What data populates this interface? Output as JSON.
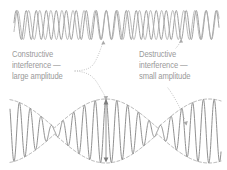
{
  "figure": {
    "background_color": "#ffffff",
    "wave_color": "#8e8e8e",
    "wave_color_secondary": "#a8a8a8",
    "envelope_color": "#8e8e8e",
    "text_color": "#9a9a9a",
    "arrow_color": "#b0b0b0"
  },
  "annotations": {
    "constructive": {
      "line1": "Constructive",
      "line2": "interference —",
      "line3": "large amplitude"
    },
    "destructive": {
      "line1": "Destructive",
      "line2": "interference —",
      "line3": "small amplitude"
    }
  },
  "chart_data": {
    "type": "line",
    "xlabel": "",
    "ylabel": "",
    "grid": false,
    "legend": null,
    "panels": [
      {
        "name": "component-waves",
        "description": "Two superposed sine waves of slightly different frequency, in phase near center, out of phase at the edges",
        "x_range": [
          0,
          227
        ],
        "y_range": [
          8,
          42
        ],
        "series": [
          {
            "name": "wave-1",
            "frequency_cycles": 20.5,
            "amplitude": 15,
            "phase_deg": 0,
            "color": "#8e8e8e"
          },
          {
            "name": "wave-2",
            "frequency_cycles": 18.5,
            "amplitude": 15,
            "phase_deg": 0,
            "color": "#a8a8a8"
          }
        ]
      },
      {
        "name": "resultant-beat-wave",
        "description": "Sum of the two component waves, showing beat pattern with maximum amplitude at center and minimum amplitude toward the right",
        "x_range": [
          0,
          227
        ],
        "y_range": [
          100,
          168
        ],
        "series": [
          {
            "name": "beat-sum",
            "carrier_cycles": 19.5,
            "beat_cycles": 1.0,
            "max_amplitude": 32,
            "min_amplitude": 4,
            "color": "#8e8e8e"
          }
        ],
        "envelopes": [
          {
            "name": "upper-envelope",
            "style": "dashed",
            "color": "#8e8e8e"
          },
          {
            "name": "lower-envelope",
            "style": "dashed",
            "color": "#8e8e8e"
          }
        ]
      }
    ],
    "markers": [
      {
        "name": "large-amplitude-double-arrow",
        "x": 106,
        "type": "double-headed-vertical-arrow",
        "meaning": "large amplitude"
      },
      {
        "name": "constructive-pointer-up",
        "x": 104,
        "y": 40,
        "type": "dotted-arrow",
        "target": "component-waves"
      },
      {
        "name": "constructive-pointer-down",
        "x": 106,
        "y": 100,
        "type": "dotted-arrow",
        "target": "resultant-beat-wave"
      },
      {
        "name": "destructive-pointer-up",
        "x": 180,
        "y": 40,
        "type": "dotted-arrow",
        "target": "component-waves"
      },
      {
        "name": "destructive-pointer-down",
        "x": 187,
        "y": 126,
        "type": "dotted-arrow",
        "target": "resultant-beat-wave"
      }
    ]
  }
}
